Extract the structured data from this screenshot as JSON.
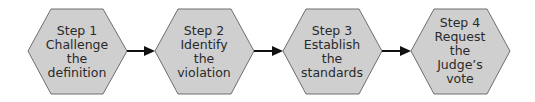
{
  "diagram": {
    "type": "process-flow",
    "colors": {
      "fill": "#cfcfcf",
      "stroke": "#6e6e6e",
      "arrow": "#111111",
      "text": "#2a2a2a"
    },
    "steps": [
      {
        "lines": [
          "Step 1",
          "Challenge",
          "the",
          "definition"
        ]
      },
      {
        "lines": [
          "Step 2",
          "Identify",
          "the",
          "violation"
        ]
      },
      {
        "lines": [
          "Step 3",
          "Establish",
          "the",
          "standards"
        ]
      },
      {
        "lines": [
          "Step 4",
          "Request",
          "the",
          "Judge’s",
          "vote"
        ]
      }
    ],
    "connectors": [
      {
        "from": 1,
        "to": 2
      },
      {
        "from": 2,
        "to": 3
      },
      {
        "from": 3,
        "to": 4
      }
    ]
  }
}
